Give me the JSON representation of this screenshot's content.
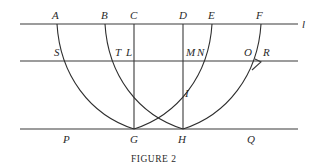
{
  "figure": {
    "caption": "FIGURE 2",
    "line_label": "l",
    "points": {
      "A": "A",
      "B": "B",
      "C": "C",
      "D": "D",
      "E": "E",
      "F": "F",
      "S": "S",
      "T": "T",
      "L": "L",
      "M": "M",
      "N": "N",
      "O": "O",
      "R": "R",
      "I": "I",
      "P": "P",
      "G": "G",
      "H": "H",
      "Q": "Q"
    },
    "colors": {
      "stroke": "#2e2e2e",
      "background": "#ffffff"
    }
  }
}
